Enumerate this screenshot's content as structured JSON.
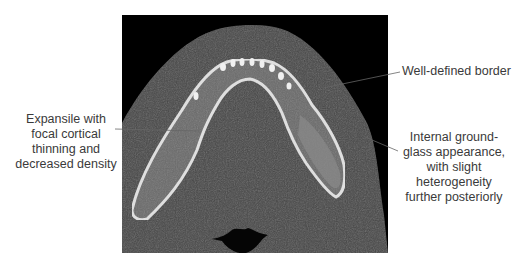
{
  "figure": {
    "image_description": "Axial CT slice of the mandible (bone window) showing a lesion in the left posterior mandibular body",
    "annotations": [
      {
        "id": "well-defined-border",
        "text": "Well-defined border"
      },
      {
        "id": "expansile",
        "text": "Expansile with focal cortical thinning and decreased density"
      },
      {
        "id": "ground-glass",
        "text": "Internal ground-glass appearance, with slight heterogeneity further posteriorly"
      }
    ],
    "colors": {
      "background": "#ffffff",
      "ct_background": "#000000",
      "soft_tissue": "#4a4a4a",
      "bone": "#d8d8d8",
      "label_text": "#3a3a3a",
      "leader_line": "#555555"
    }
  }
}
